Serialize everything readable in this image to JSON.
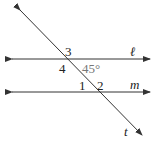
{
  "diagram": {
    "lines": [
      {
        "name": "line-l",
        "label": "ℓ"
      },
      {
        "name": "line-m",
        "label": "m"
      },
      {
        "name": "transversal-t",
        "label": "t"
      }
    ],
    "angle_labels": [
      "3",
      "4",
      "45°",
      "1",
      "2"
    ],
    "colors": {
      "line": "#333333",
      "given_angle": "#777777"
    }
  }
}
